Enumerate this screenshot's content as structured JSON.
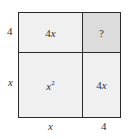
{
  "diagram": {
    "type": "area-model",
    "cells": {
      "top_left": {
        "coef": "4",
        "var": "x"
      },
      "top_right": {
        "text": "?"
      },
      "bottom_left": {
        "var": "x",
        "exp": "2"
      },
      "bottom_right": {
        "coef": "4",
        "var": "x"
      }
    },
    "side_labels": {
      "left_top": "4",
      "left_bottom": "x",
      "bottom_left": "x",
      "bottom_right": "4"
    },
    "colors": {
      "cell_fill": "#f0f0f0",
      "unknown_cell_fill": "#dcdcdc",
      "border": "#2a2a2a"
    }
  }
}
